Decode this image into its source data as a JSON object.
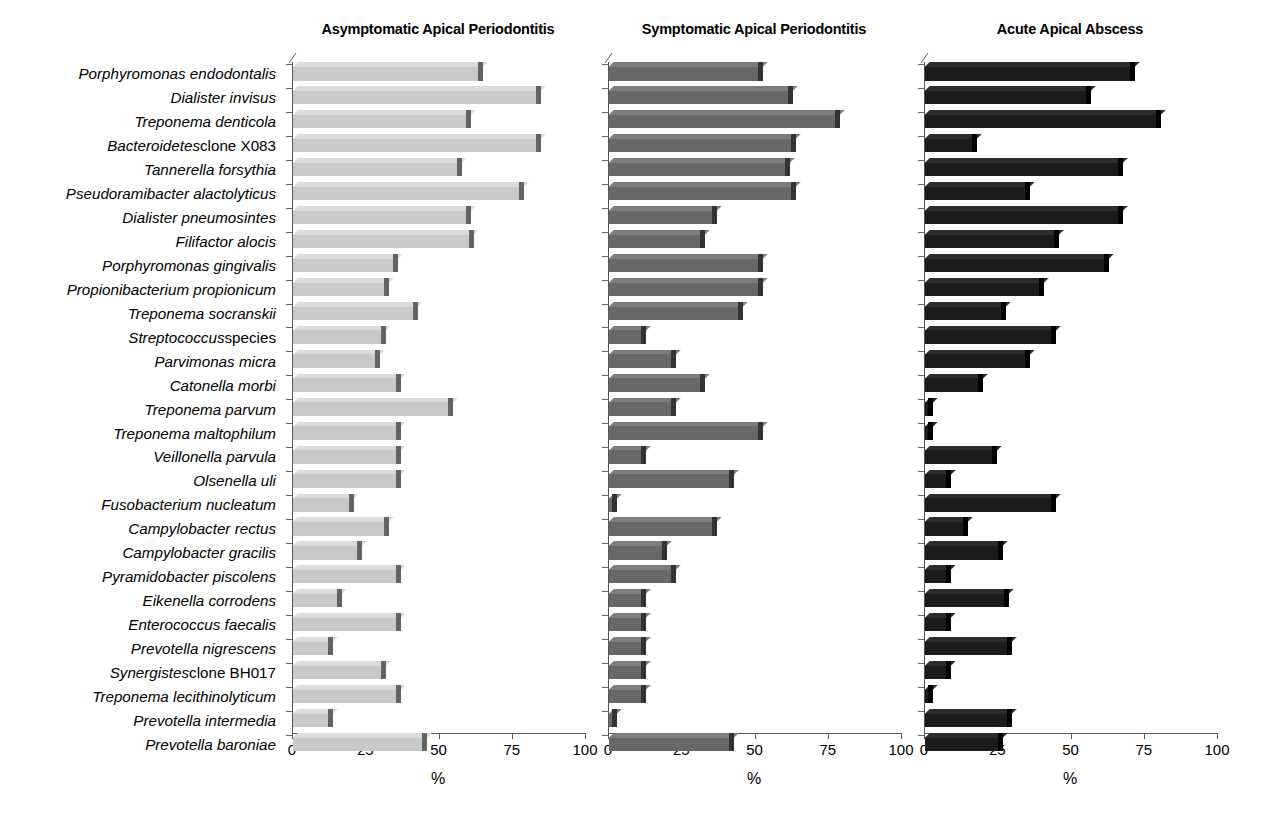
{
  "chart_data": {
    "type": "bar",
    "orientation": "horizontal",
    "title": "",
    "xlabel": "%",
    "ylabel": "",
    "xlim": [
      0,
      100
    ],
    "xticks": [
      0,
      25,
      50,
      75,
      100
    ],
    "xtick_labels": [
      "0",
      "25",
      "50",
      "75",
      "100"
    ],
    "grid": false,
    "legend": "none",
    "panel_layout": "three side-by-side panels sharing one category axis",
    "categories": [
      "Porphyromonas endodontalis",
      "Dialister invisus",
      "Treponema denticola",
      "Bacteroidetes clone X083",
      "Tannerella forsythia",
      "Pseudoramibacter alactolyticus",
      "Dialister pneumosintes",
      "Filifactor alocis",
      "Porphyromonas gingivalis",
      "Propionibacterium propionicum",
      "Treponema socranskii",
      "Streptococcus species",
      "Parvimonas micra",
      "Catonella morbi",
      "Treponema parvum",
      "Treponema maltophilum",
      "Veillonella parvula",
      "Olsenella uli",
      "Fusobacterium nucleatum",
      "Campylobacter rectus",
      "Campylobacter gracilis",
      "Pyramidobacter piscolens",
      "Eikenella corrodens",
      "Enterococcus faecalis",
      "Prevotella nigrescens",
      "Synergistes clone BH017",
      "Treponema lecithinolyticum",
      "Prevotella intermedia",
      "Prevotella baroniae"
    ],
    "category_parts": [
      {
        "italic": "Porphyromonas endodontalis",
        "roman": ""
      },
      {
        "italic": "Dialister invisus",
        "roman": ""
      },
      {
        "italic": "Treponema denticola",
        "roman": ""
      },
      {
        "italic": "Bacteroidetes",
        "roman": " clone X083"
      },
      {
        "italic": "Tannerella forsythia",
        "roman": ""
      },
      {
        "italic": "Pseudoramibacter alactolyticus",
        "roman": ""
      },
      {
        "italic": "Dialister pneumosintes",
        "roman": ""
      },
      {
        "italic": "Filifactor alocis",
        "roman": ""
      },
      {
        "italic": "Porphyromonas gingivalis",
        "roman": ""
      },
      {
        "italic": "Propionibacterium propionicum",
        "roman": ""
      },
      {
        "italic": "Treponema socranskii",
        "roman": ""
      },
      {
        "italic": "Streptococcus",
        "roman": " species"
      },
      {
        "italic": "Parvimonas micra",
        "roman": ""
      },
      {
        "italic": "Catonella morbi",
        "roman": ""
      },
      {
        "italic": "Treponema parvum",
        "roman": ""
      },
      {
        "italic": "Treponema maltophilum",
        "roman": ""
      },
      {
        "italic": "Veillonella parvula",
        "roman": ""
      },
      {
        "italic": "Olsenella uli",
        "roman": ""
      },
      {
        "italic": "Fusobacterium nucleatum",
        "roman": ""
      },
      {
        "italic": "Campylobacter rectus",
        "roman": ""
      },
      {
        "italic": "Campylobacter gracilis",
        "roman": ""
      },
      {
        "italic": "Pyramidobacter piscolens",
        "roman": ""
      },
      {
        "italic": "Eikenella corrodens",
        "roman": ""
      },
      {
        "italic": "Enterococcus faecalis",
        "roman": ""
      },
      {
        "italic": "Prevotella nigrescens",
        "roman": ""
      },
      {
        "italic": "Synergistes",
        "roman": " clone BH017"
      },
      {
        "italic": "Treponema lecithinolyticum",
        "roman": ""
      },
      {
        "italic": "Prevotella intermedia",
        "roman": ""
      },
      {
        "italic": "Prevotella baroniae",
        "roman": ""
      }
    ],
    "series": [
      {
        "name": "Asymptomatic Apical Periodontitis",
        "color": "#c9c9c9",
        "values": [
          63,
          83,
          59,
          83,
          56,
          77,
          59,
          60,
          34,
          31,
          41,
          30,
          28,
          35,
          53,
          35,
          35,
          35,
          19,
          31,
          22,
          35,
          15,
          35,
          12,
          30,
          35,
          12,
          44
        ]
      },
      {
        "name": "Symptomatic Apical Periodontitis",
        "color": "#686868",
        "values": [
          51,
          61,
          77,
          62,
          60,
          62,
          35,
          31,
          51,
          51,
          44,
          11,
          21,
          31,
          21,
          51,
          11,
          41,
          1,
          35,
          18,
          21,
          11,
          11,
          11,
          11,
          11,
          1,
          41
        ]
      },
      {
        "name": "Acute Apical Abscess",
        "color": "#1b1b1b",
        "values": [
          70,
          55,
          79,
          16,
          66,
          34,
          66,
          44,
          61,
          39,
          26,
          43,
          34,
          18,
          1,
          1,
          23,
          7,
          43,
          13,
          25,
          7,
          27,
          7,
          28,
          7,
          1,
          28,
          25
        ]
      }
    ]
  },
  "panels": [
    {
      "title": "Asymptomatic Apical Periodontitis",
      "axis_caption": "%"
    },
    {
      "title": "Symptomatic Apical Periodontitis",
      "axis_caption": "%"
    },
    {
      "title": "Acute Apical Abscess",
      "axis_caption": "%"
    }
  ]
}
